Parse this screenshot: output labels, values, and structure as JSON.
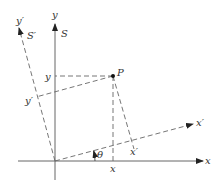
{
  "diagram": {
    "frames": {
      "S": {
        "label": "S",
        "x_axis": "x",
        "y_axis": "y"
      },
      "S_prime": {
        "label": "S′",
        "x_axis": "x′",
        "y_axis": "y′"
      }
    },
    "point": {
      "label": "P"
    },
    "angle": {
      "label": "θ"
    },
    "projections": {
      "x": "x",
      "y": "y",
      "x_prime": "x′",
      "y_prime": "y′"
    },
    "colors": {
      "axis": "#666666",
      "dashed": "#666666",
      "text": "#333333",
      "point": "#111111"
    }
  }
}
